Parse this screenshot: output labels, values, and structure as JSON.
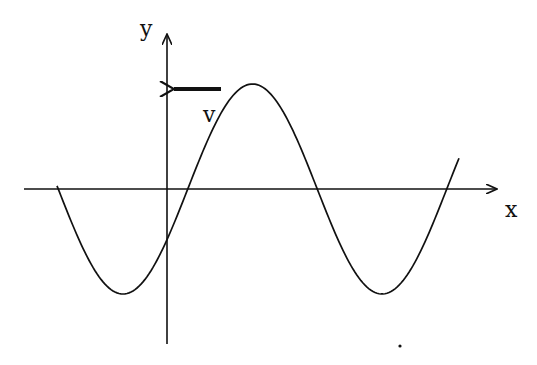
{
  "diagram": {
    "title": "",
    "axes": {
      "x_label": "x",
      "y_label": "y"
    },
    "velocity": {
      "label": "v",
      "direction": "left"
    },
    "wave": {
      "type": "sinusoid",
      "description": "transverse wave travelling in -x direction",
      "crests_visible": 1,
      "troughs_visible": 2
    },
    "colors": {
      "line": "#111111",
      "background": "#ffffff"
    }
  }
}
